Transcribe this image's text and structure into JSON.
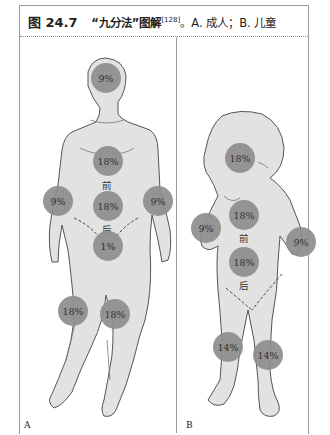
{
  "caption": {
    "figure_number": "图 24.7",
    "title": "“九分法”图解",
    "reference": "[128]",
    "description": "。A. 成人；B. 儿童"
  },
  "panels": {
    "adult": {
      "label": "A",
      "zones": {
        "head": "9%",
        "chest_front": "18%",
        "back": "18%",
        "left_arm": "9%",
        "right_arm": "9%",
        "perineum": "1%",
        "left_leg": "18%",
        "right_leg": "18%"
      },
      "front_label": "前",
      "back_label": "后"
    },
    "child": {
      "label": "B",
      "zones": {
        "head": "18%",
        "chest_front": "18%",
        "back": "18%",
        "left_arm": "9%",
        "right_arm": "9%",
        "left_leg": "14%",
        "right_leg": "14%"
      },
      "front_label": "前",
      "back_label": "后"
    }
  },
  "colors": {
    "body_fill": "#e2e2e2",
    "body_outline": "#555555",
    "zone_fill": "#8e8e8e",
    "frame": "#9a9a9a"
  }
}
